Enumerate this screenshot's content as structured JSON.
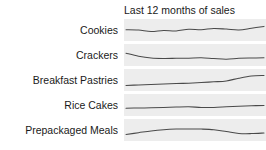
{
  "chart_data": {
    "type": "line",
    "title": "Last 12 months of sales",
    "xlabel": "",
    "ylabel": "",
    "grid": false,
    "legend_position": "none",
    "layout": "sparkline-table",
    "x": [
      1,
      2,
      3,
      4,
      5,
      6,
      7,
      8,
      9,
      10,
      11,
      12
    ],
    "ylim": [
      0,
      1
    ],
    "band_color": "#ededed",
    "line_color": "#4a4a4a",
    "series": [
      {
        "name": "Cookies",
        "values": [
          0.52,
          0.5,
          0.4,
          0.47,
          0.44,
          0.55,
          0.52,
          0.6,
          0.56,
          0.5,
          0.62,
          0.74
        ]
      },
      {
        "name": "Crackers",
        "values": [
          0.62,
          0.42,
          0.3,
          0.27,
          0.28,
          0.29,
          0.31,
          0.26,
          0.22,
          0.28,
          0.3,
          0.31
        ]
      },
      {
        "name": "Breakfast Pastries",
        "values": [
          0.14,
          0.17,
          0.2,
          0.23,
          0.26,
          0.29,
          0.33,
          0.38,
          0.44,
          0.62,
          0.76,
          0.8
        ]
      },
      {
        "name": "Rice Cakes",
        "values": [
          0.28,
          0.3,
          0.31,
          0.33,
          0.36,
          0.38,
          0.34,
          0.34,
          0.38,
          0.42,
          0.45,
          0.47
        ]
      },
      {
        "name": "Prepackaged Meals",
        "values": [
          0.2,
          0.32,
          0.44,
          0.52,
          0.56,
          0.57,
          0.56,
          0.52,
          0.4,
          0.27,
          0.26,
          0.3
        ]
      }
    ]
  },
  "rows": [
    {
      "label": "Cookies"
    },
    {
      "label": "Crackers"
    },
    {
      "label": "Breakfast Pastries"
    },
    {
      "label": "Rice Cakes"
    },
    {
      "label": "Prepackaged Meals"
    }
  ]
}
